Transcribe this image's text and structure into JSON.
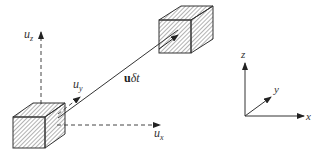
{
  "diagram": {
    "labels": {
      "uz_main": "u",
      "uz_sub": "z",
      "uy_main": "u",
      "uy_sub": "y",
      "ux_main": "u",
      "ux_sub": "x",
      "displacement_bold": "u",
      "displacement_rest": "δt",
      "frame_z": "z",
      "frame_y": "y",
      "frame_x": "x"
    },
    "colors": {
      "line": "#333333",
      "hatch": "#555555",
      "background": "#ffffff"
    }
  }
}
